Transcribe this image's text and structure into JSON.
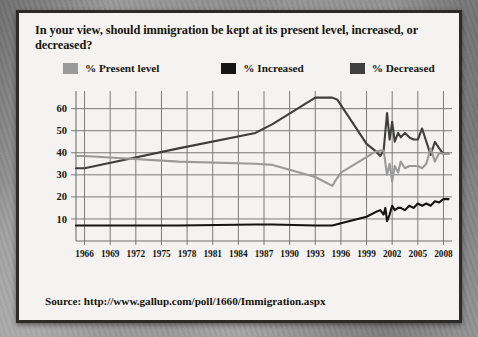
{
  "card": {
    "title": "In your view, should immigration be kept at its present level, increased, or decreased?",
    "source": "Source: http://www.gallup.com/poll/1660/Immigration.aspx"
  },
  "colors": {
    "present_level": "#9a9a9a",
    "increased": "#141414",
    "decreased": "#3f3f3f",
    "grid": "#6e6e6e",
    "text": "#17150f",
    "card_bg": "#f4f3f1",
    "card_border": "#2c2b29"
  },
  "legend": {
    "position": "top",
    "items": [
      {
        "label": "% Present level",
        "color": "#9a9a9a",
        "swatch": "legend-swatch-present"
      },
      {
        "label": "% Increased",
        "color": "#141414",
        "swatch": "legend-swatch-increased"
      },
      {
        "label": "% Decreased",
        "color": "#3f3f3f",
        "swatch": "legend-swatch-decreased"
      }
    ]
  },
  "chart_data": {
    "type": "line",
    "title": "In your view, should immigration be kept at its present level, increased, or decreased?",
    "xlabel": "",
    "ylabel": "",
    "xlim": [
      1965,
      2009
    ],
    "ylim": [
      0,
      68
    ],
    "grid": true,
    "yticks": [
      10,
      20,
      30,
      40,
      50,
      60
    ],
    "xticks": [
      1966,
      1969,
      1972,
      1975,
      1978,
      1981,
      1984,
      1987,
      1990,
      1993,
      1996,
      1999,
      2002,
      2005,
      2008
    ],
    "series": [
      {
        "name": "% Decreased",
        "color": "#3f3f3f",
        "points": [
          [
            1965,
            33
          ],
          [
            1966,
            33
          ],
          [
            1977,
            42
          ],
          [
            1986,
            49
          ],
          [
            1988,
            53
          ],
          [
            1993,
            65
          ],
          [
            1995,
            65
          ],
          [
            1995.6,
            64
          ],
          [
            1999,
            44
          ],
          [
            2000,
            41
          ],
          [
            2000.6,
            38.5
          ],
          [
            2001,
            41
          ],
          [
            2001.4,
            58
          ],
          [
            2001.7,
            46
          ],
          [
            2002,
            54
          ],
          [
            2002.3,
            45
          ],
          [
            2002.7,
            49
          ],
          [
            2003,
            47
          ],
          [
            2003.5,
            49
          ],
          [
            2004,
            47
          ],
          [
            2004.5,
            46
          ],
          [
            2005,
            46
          ],
          [
            2005.5,
            51
          ],
          [
            2006,
            45
          ],
          [
            2006.5,
            39
          ],
          [
            2007,
            45
          ],
          [
            2007.5,
            42
          ],
          [
            2008,
            39.5
          ],
          [
            2008.6,
            39.5
          ]
        ]
      },
      {
        "name": "% Present level",
        "color": "#9a9a9a",
        "points": [
          [
            1965,
            38.5
          ],
          [
            1966,
            38.5
          ],
          [
            1977,
            36
          ],
          [
            1986,
            35
          ],
          [
            1988,
            34.5
          ],
          [
            1993,
            29
          ],
          [
            1995,
            25
          ],
          [
            1995.3,
            27
          ],
          [
            1996,
            31
          ],
          [
            1999,
            38
          ],
          [
            2000,
            40.5
          ],
          [
            2000.6,
            41
          ],
          [
            2001,
            41
          ],
          [
            2001.4,
            30
          ],
          [
            2001.7,
            35
          ],
          [
            2002,
            27
          ],
          [
            2002.3,
            34
          ],
          [
            2002.7,
            31
          ],
          [
            2003,
            36
          ],
          [
            2003.5,
            33
          ],
          [
            2004,
            34
          ],
          [
            2004.5,
            34
          ],
          [
            2005,
            34
          ],
          [
            2005.5,
            33
          ],
          [
            2006,
            35
          ],
          [
            2006.5,
            42
          ],
          [
            2007,
            36
          ],
          [
            2007.5,
            40
          ],
          [
            2008,
            39.5
          ],
          [
            2008.6,
            39.5
          ]
        ]
      },
      {
        "name": "% Increased",
        "color": "#141414",
        "points": [
          [
            1965,
            7
          ],
          [
            1966,
            7
          ],
          [
            1977,
            7
          ],
          [
            1986,
            7.5
          ],
          [
            1988,
            7.5
          ],
          [
            1993,
            7
          ],
          [
            1995,
            7
          ],
          [
            1996,
            8
          ],
          [
            1999,
            11
          ],
          [
            2000,
            13
          ],
          [
            2000.6,
            14
          ],
          [
            2001,
            12
          ],
          [
            2001.2,
            15
          ],
          [
            2001.4,
            9
          ],
          [
            2001.7,
            12
          ],
          [
            2002,
            16
          ],
          [
            2002.3,
            14
          ],
          [
            2002.7,
            15
          ],
          [
            2003,
            15
          ],
          [
            2003.5,
            14
          ],
          [
            2004,
            16
          ],
          [
            2004.5,
            15
          ],
          [
            2005,
            17
          ],
          [
            2005.5,
            16
          ],
          [
            2006,
            17
          ],
          [
            2006.5,
            16
          ],
          [
            2007,
            18
          ],
          [
            2007.5,
            17.5
          ],
          [
            2008,
            19
          ],
          [
            2008.6,
            19
          ]
        ]
      }
    ]
  }
}
